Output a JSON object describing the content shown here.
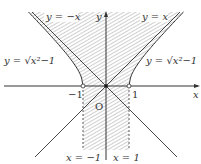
{
  "diagram": {
    "labels": {
      "y_neg_x": "y = −x",
      "y_pos_x": "y = x",
      "y_axis": "y",
      "x_axis": "x",
      "curve_left": "y = √x²−1",
      "curve_right": "y = √x²−1",
      "tick_neg1": "−1",
      "tick_pos1": "1",
      "origin": "O",
      "line_x_neg1": "x = −1",
      "line_x_pos1": "x = 1"
    },
    "region_description": "Shaded region: above x-axis between branches of y = √(x²−1) (|x|≤1 or y≥√(x²−1)), below x-axis for −1≤x≤1",
    "open_points": [
      [
        -1,
        0
      ],
      [
        1,
        0
      ]
    ],
    "closed_points": [
      [
        0,
        0
      ]
    ]
  }
}
